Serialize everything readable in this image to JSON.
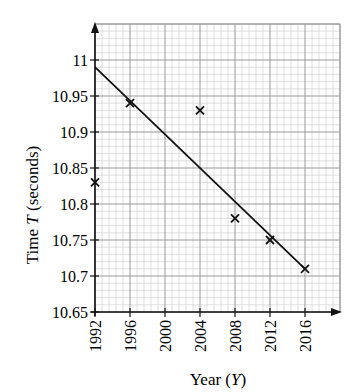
{
  "chart_data": {
    "type": "scatter",
    "title": "",
    "xlabel": "Year (Y)",
    "ylabel": "Time T (seconds)",
    "xlabel_parts": {
      "prefix": "Year (",
      "var": "Y",
      "suffix": ")"
    },
    "ylabel_parts": {
      "prefix": "Time ",
      "var": "T",
      "suffix": " (seconds)"
    },
    "xlim": [
      1992,
      2020
    ],
    "ylim": [
      10.65,
      11.05
    ],
    "x_ticks": [
      1992,
      1996,
      2000,
      2004,
      2008,
      2012,
      2016
    ],
    "x_tick_labels": [
      "1992",
      "1996",
      "2000",
      "2004",
      "2008",
      "2012",
      "2016"
    ],
    "y_ticks": [
      10.65,
      10.7,
      10.75,
      10.8,
      10.85,
      10.9,
      10.95,
      11
    ],
    "y_tick_labels": [
      "10.65",
      "10.7",
      "10.75",
      "10.8",
      "10.85",
      "10.9",
      "10.95",
      "11"
    ],
    "grid": true,
    "minor_grid_divisions": 5,
    "legend": null,
    "series": [
      {
        "name": "Winning times",
        "type": "scatter",
        "marker": "x",
        "x": [
          1992,
          1996,
          2004,
          2008,
          2012,
          2016
        ],
        "y": [
          10.83,
          10.94,
          10.93,
          10.78,
          10.75,
          10.71
        ]
      },
      {
        "name": "Line of best fit",
        "type": "line",
        "x": [
          1992,
          2016
        ],
        "y": [
          10.99,
          10.71
        ]
      }
    ]
  },
  "header_fragment": "…ry … … ……, ……"
}
